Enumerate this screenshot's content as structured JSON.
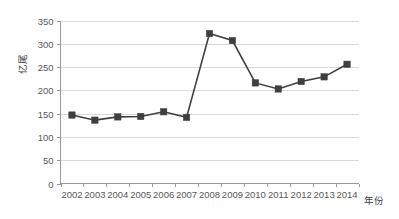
{
  "chart_data": {
    "type": "line",
    "title": "",
    "subtitle": "",
    "xlabel": "年份",
    "ylabel": "亿尾",
    "categories": [
      "2002",
      "2003",
      "2004",
      "2005",
      "2006",
      "2007",
      "2008",
      "2009",
      "2010",
      "2011",
      "2012",
      "2013",
      "2014"
    ],
    "values": [
      147,
      136,
      143,
      144,
      154,
      142,
      322,
      307,
      216,
      203,
      219,
      229,
      256
    ],
    "series": [
      {
        "name": "",
        "values": [
          147,
          136,
          143,
          144,
          154,
          142,
          322,
          307,
          216,
          203,
          219,
          229,
          256
        ],
        "color": "#3f3f3f",
        "marker": "square"
      }
    ],
    "ylim": [
      0,
      350
    ],
    "yticks": [
      0,
      50,
      100,
      150,
      200,
      250,
      300,
      350
    ],
    "ytick_labels": [
      "0",
      "50",
      "100",
      "150",
      "200",
      "250",
      "300",
      "350"
    ],
    "xtick_labels": [
      "2002",
      "2003",
      "2004",
      "2005",
      "2006",
      "2007",
      "2008",
      "2009",
      "2010",
      "2011",
      "2012",
      "2013",
      "2014"
    ],
    "grid": {
      "horizontal": true,
      "vertical": false,
      "color": "#d9d9d9"
    },
    "legend": {
      "visible": false,
      "position": "none",
      "entries": []
    },
    "annotations": [],
    "colors": {
      "line": "#3f3f3f",
      "marker": "#3f3f3f",
      "grid": "#d9d9d9",
      "axis": "#9a9a9a",
      "text": "#595959",
      "background": "#ffffff"
    }
  },
  "axes": {
    "y_axis_title": "亿尾",
    "x_axis_title": "年份"
  }
}
